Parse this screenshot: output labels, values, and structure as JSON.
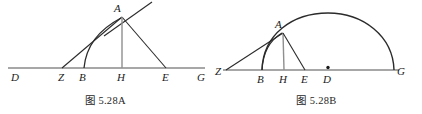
{
  "page": {
    "background_color": "#ffffff",
    "baseline_color": "#8a8a8a",
    "stroke_color": "#2b2b2b",
    "label_color": "#1a1a1a",
    "width": 422,
    "height": 114
  },
  "figures": [
    {
      "id": "figure-a",
      "caption": "图 5.28A",
      "description": "triangle with tangent at A and arc from B to A over line D-Z-B-H-E-G",
      "baseline": {
        "label_from": "D",
        "label_to": "G",
        "y": 68,
        "x_start": 8,
        "x_end": 205
      },
      "points": [
        {
          "name": "D",
          "label": "D",
          "x": 14,
          "y": 68,
          "label_x": 11,
          "label_y": 81
        },
        {
          "name": "Z",
          "label": "Z",
          "x": 62,
          "y": 68,
          "label_x": 58,
          "label_y": 81
        },
        {
          "name": "B",
          "label": "B",
          "x": 84,
          "y": 68,
          "label_x": 79,
          "label_y": 81
        },
        {
          "name": "H",
          "label": "H",
          "x": 122,
          "y": 68,
          "label_x": 117,
          "label_y": 81
        },
        {
          "name": "E",
          "label": "E",
          "x": 166,
          "y": 68,
          "label_x": 162,
          "label_y": 81
        },
        {
          "name": "G",
          "label": "G",
          "x": 201,
          "y": 68,
          "label_x": 197,
          "label_y": 81
        },
        {
          "name": "A",
          "label": "A",
          "x": 122,
          "y": 17,
          "label_x": 114,
          "label_y": 12
        }
      ],
      "segments": [
        {
          "name": "segment-z-a",
          "from": "Z",
          "to": "A"
        },
        {
          "name": "segment-a-e",
          "from": "A",
          "to": "E"
        },
        {
          "name": "segment-a-h",
          "from": "A",
          "to": "H"
        },
        {
          "name": "tangent-at-a",
          "from": "A",
          "to": "tangent-end"
        }
      ],
      "tangent_end": {
        "x": 152,
        "y": 2
      },
      "arc": {
        "name": "arc-b-a",
        "from": "B",
        "to": "A"
      }
    },
    {
      "id": "figure-b",
      "caption": "图 5.28B",
      "description": "semicircle on diameter with center D, chord from Z through A to arc, points Z-B-H-E-D-G",
      "baseline": {
        "label_from": "Z",
        "label_to": "G",
        "y": 70,
        "x_start": 6,
        "x_end": 190
      },
      "points": [
        {
          "name": "Z",
          "label": "Z",
          "x": 15,
          "y": 70,
          "label_x": 5,
          "label_y": 74
        },
        {
          "name": "B",
          "label": "B",
          "x": 51,
          "y": 70,
          "label_x": 46,
          "label_y": 83
        },
        {
          "name": "H",
          "label": "H",
          "x": 73,
          "y": 70,
          "label_x": 68,
          "label_y": 83
        },
        {
          "name": "E",
          "label": "E",
          "x": 94,
          "y": 70,
          "label_x": 90,
          "label_y": 83
        },
        {
          "name": "D",
          "label": "D",
          "x": 117,
          "y": 70,
          "label_x": 112,
          "label_y": 83
        },
        {
          "name": "G",
          "label": "G",
          "x": 183,
          "y": 70,
          "label_x": 186,
          "label_y": 75
        },
        {
          "name": "A",
          "label": "A",
          "x": 72,
          "y": 33,
          "label_x": 64,
          "label_y": 28
        }
      ],
      "center_dot": {
        "name": "center-point-d",
        "x": 117,
        "y": 68,
        "r": 1.6
      },
      "segments": [
        {
          "name": "segment-z-a",
          "from": "Z",
          "to": "A"
        },
        {
          "name": "segment-a-h",
          "from": "A",
          "to": "H"
        },
        {
          "name": "segment-a-e",
          "from": "A",
          "to": "E"
        }
      ],
      "arcs": [
        {
          "name": "arc-semicircle-b-g",
          "from": "B",
          "to": "G",
          "note": "large arc over diameter"
        },
        {
          "name": "arc-small-b-a",
          "from": "B",
          "to": "A",
          "note": "small arc from B up to A"
        }
      ]
    }
  ]
}
